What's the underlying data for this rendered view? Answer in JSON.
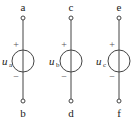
{
  "diagram": {
    "sources": [
      {
        "top": "a",
        "bottom": "b",
        "symbol": "u",
        "sub": "a",
        "plus": "+",
        "minus": "−",
        "x": 23
      },
      {
        "top": "c",
        "bottom": "d",
        "symbol": "u",
        "sub": "b",
        "plus": "+",
        "minus": "−",
        "x": 71
      },
      {
        "top": "e",
        "bottom": "f",
        "symbol": "u",
        "sub": "c",
        "plus": "+",
        "minus": "−",
        "x": 119
      }
    ]
  }
}
